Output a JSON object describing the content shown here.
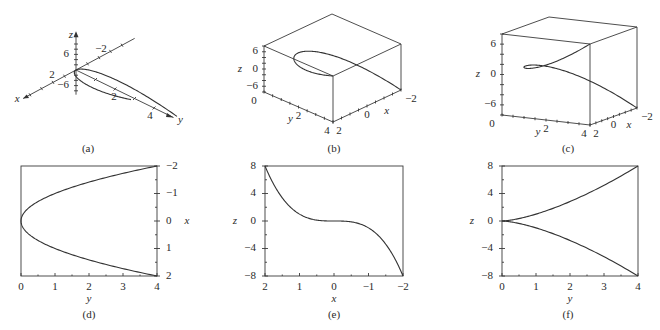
{
  "figure": {
    "parametric": {
      "x": "t",
      "y": "t^2",
      "z": "t^3",
      "t_range": [
        -2,
        2
      ]
    },
    "colors": {
      "line": "#333333",
      "background": "#ffffff"
    }
  },
  "chart_data": [
    {
      "id": "a",
      "type": "line",
      "view": "3d-axes",
      "caption": "(a)",
      "axis_labels": {
        "x": "x",
        "y": "y",
        "z": "z"
      },
      "tick_labels": {
        "x": [
          "2",
          "-2"
        ],
        "y": [
          "2",
          "4"
        ],
        "z": [
          "6",
          "-6"
        ]
      },
      "series": [
        {
          "name": "curve",
          "t_range": [
            -2,
            2
          ]
        }
      ]
    },
    {
      "id": "b",
      "type": "line",
      "view": "3d-box",
      "caption": "(b)",
      "axis_labels": {
        "x": "x",
        "y": "y",
        "z": "z"
      },
      "tick_labels": {
        "z": [
          "6",
          "0",
          "-6"
        ],
        "y": [
          "0",
          "2",
          "4"
        ],
        "x": [
          "2",
          "0",
          "-2"
        ]
      },
      "ranges": {
        "x": [
          -2,
          2
        ],
        "y": [
          0,
          4
        ],
        "z": [
          -8,
          8
        ]
      },
      "series": [
        {
          "name": "curve",
          "t_range": [
            -2,
            2
          ]
        }
      ]
    },
    {
      "id": "c",
      "type": "line",
      "view": "3d-box",
      "caption": "(c)",
      "axis_labels": {
        "x": "x",
        "y": "y",
        "z": "z"
      },
      "tick_labels": {
        "z": [
          "6",
          "0",
          "-6"
        ],
        "y": [
          "0",
          "2",
          "4"
        ],
        "x": [
          "2",
          "0",
          "-2"
        ]
      },
      "ranges": {
        "x": [
          -2,
          2
        ],
        "y": [
          0,
          4
        ],
        "z": [
          -8,
          8
        ]
      },
      "series": [
        {
          "name": "curve",
          "t_range": [
            -2,
            2
          ]
        }
      ]
    },
    {
      "id": "d",
      "type": "line",
      "caption": "(d)",
      "xlabel": "y",
      "ylabel": "x",
      "xlim": [
        0,
        4
      ],
      "ylim": [
        2,
        -2
      ],
      "xticks": [
        "0",
        "1",
        "2",
        "3",
        "4"
      ],
      "yticks": [
        "-2",
        "-1",
        "0",
        "1",
        "2"
      ],
      "yaxis_side": "right",
      "series": [
        {
          "name": "y = x^2 (x vs y)",
          "relation": "y = x^2",
          "x_range": [
            -2,
            2
          ]
        }
      ]
    },
    {
      "id": "e",
      "type": "line",
      "caption": "(e)",
      "xlabel": "x",
      "ylabel": "z",
      "xlim": [
        2,
        -2
      ],
      "ylim": [
        -8,
        8
      ],
      "xticks": [
        "2",
        "1",
        "0",
        "-1",
        "-2"
      ],
      "yticks": [
        "8",
        "4",
        "0",
        "-4",
        "-8"
      ],
      "yaxis_side": "left",
      "series": [
        {
          "name": "z = x^3",
          "relation": "z = x^3",
          "x_range": [
            -2,
            2
          ]
        }
      ]
    },
    {
      "id": "f",
      "type": "line",
      "caption": "(f)",
      "xlabel": "y",
      "ylabel": "z",
      "xlim": [
        0,
        4
      ],
      "ylim": [
        -8,
        8
      ],
      "xticks": [
        "0",
        "1",
        "2",
        "3",
        "4"
      ],
      "yticks": [
        "8",
        "4",
        "0",
        "-4",
        "-8"
      ],
      "yaxis_side": "left",
      "series": [
        {
          "name": "z = y^(3/2)",
          "relation": "z = y^1.5",
          "y_range": [
            0,
            4
          ]
        },
        {
          "name": "z = -y^(3/2)",
          "relation": "z = -y^1.5",
          "y_range": [
            0,
            4
          ]
        }
      ]
    }
  ]
}
